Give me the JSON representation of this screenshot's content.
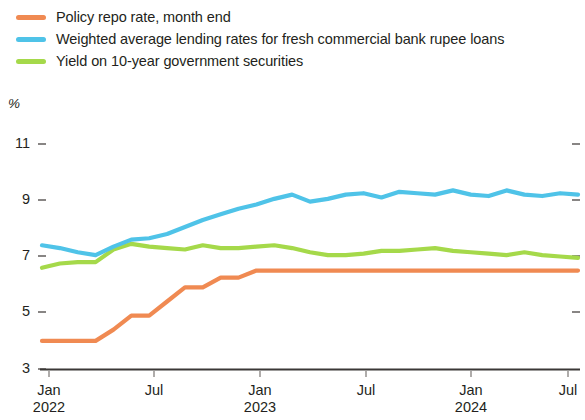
{
  "legend": {
    "items": [
      {
        "label": "Policy repo rate, month end",
        "color": "#F08A52",
        "key": "repo"
      },
      {
        "label": "Weighted average lending rates for fresh commercial bank rupee loans",
        "color": "#4FC3E8",
        "key": "walr"
      },
      {
        "label": "Yield on 10-year government securities",
        "color": "#A5D94A",
        "key": "gsec"
      }
    ]
  },
  "axes": {
    "unit_label": "%",
    "y_ticks": [
      "11",
      "9",
      "7",
      "5",
      "3"
    ],
    "x_ticks": [
      {
        "month": "Jan",
        "year": "2022"
      },
      {
        "month": "Jul",
        "year": ""
      },
      {
        "month": "Jan",
        "year": "2023"
      },
      {
        "month": "Jul",
        "year": ""
      },
      {
        "month": "Jan",
        "year": "2024"
      },
      {
        "month": "Jul",
        "year": ""
      }
    ]
  },
  "chart_data": {
    "type": "line",
    "title": "",
    "subtitle": "",
    "xlabel": "",
    "ylabel": "%",
    "ylim": [
      3,
      11
    ],
    "yticks": [
      3,
      5,
      7,
      9,
      11
    ],
    "grid": false,
    "legend_position": "top-left",
    "x": [
      "2022-01",
      "2022-02",
      "2022-03",
      "2022-04",
      "2022-05",
      "2022-06",
      "2022-07",
      "2022-08",
      "2022-09",
      "2022-10",
      "2022-11",
      "2022-12",
      "2023-01",
      "2023-02",
      "2023-03",
      "2023-04",
      "2023-05",
      "2023-06",
      "2023-07",
      "2023-08",
      "2023-09",
      "2023-10",
      "2023-11",
      "2023-12",
      "2024-01",
      "2024-02",
      "2024-03",
      "2024-04",
      "2024-05",
      "2024-06",
      "2024-07"
    ],
    "xticklabels": [
      "Jan 2022",
      "Jul",
      "Jan 2023",
      "Jul",
      "Jan 2024",
      "Jul"
    ],
    "series": [
      {
        "name": "Policy repo rate, month end",
        "color": "#F08A52",
        "values": [
          4.0,
          4.0,
          4.0,
          4.0,
          4.4,
          4.9,
          4.9,
          5.4,
          5.9,
          5.9,
          6.25,
          6.25,
          6.5,
          6.5,
          6.5,
          6.5,
          6.5,
          6.5,
          6.5,
          6.5,
          6.5,
          6.5,
          6.5,
          6.5,
          6.5,
          6.5,
          6.5,
          6.5,
          6.5,
          6.5,
          6.5
        ]
      },
      {
        "name": "Weighted average lending rates for fresh commercial bank rupee loans",
        "color": "#4FC3E8",
        "values": [
          7.4,
          7.3,
          7.15,
          7.05,
          7.35,
          7.6,
          7.65,
          7.8,
          8.05,
          8.3,
          8.5,
          8.7,
          8.85,
          9.05,
          9.2,
          8.95,
          9.05,
          9.2,
          9.25,
          9.1,
          9.3,
          9.25,
          9.2,
          9.35,
          9.2,
          9.15,
          9.35,
          9.2,
          9.15,
          9.25,
          9.2
        ]
      },
      {
        "name": "Yield on 10-year government securities",
        "color": "#A5D94A",
        "values": [
          6.6,
          6.75,
          6.8,
          6.8,
          7.25,
          7.45,
          7.35,
          7.3,
          7.25,
          7.4,
          7.3,
          7.3,
          7.35,
          7.4,
          7.3,
          7.15,
          7.05,
          7.05,
          7.1,
          7.2,
          7.2,
          7.25,
          7.3,
          7.2,
          7.15,
          7.1,
          7.05,
          7.15,
          7.05,
          7.0,
          6.95
        ]
      }
    ]
  }
}
